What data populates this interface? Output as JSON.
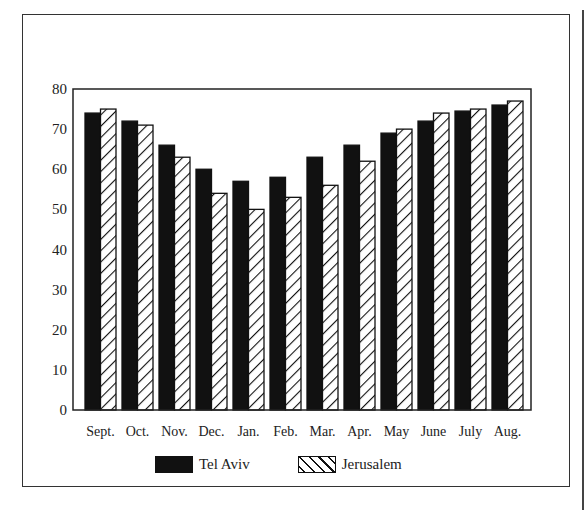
{
  "chart_data": {
    "type": "bar",
    "title": "",
    "xlabel": "",
    "ylabel": "",
    "ylim": [
      0,
      80
    ],
    "yticks": [
      0,
      10,
      20,
      30,
      40,
      50,
      60,
      70,
      80
    ],
    "grid": false,
    "legend_position": "bottom",
    "categories": [
      "Sept.",
      "Oct.",
      "Nov.",
      "Dec.",
      "Jan.",
      "Feb.",
      "Mar.",
      "Apr.",
      "May",
      "June",
      "July",
      "Aug."
    ],
    "series": [
      {
        "name": "Tel Aviv",
        "pattern": "solid",
        "color": "#111111",
        "values": [
          74,
          72,
          66,
          60,
          57,
          58,
          63,
          66,
          69,
          72,
          74.5,
          76
        ]
      },
      {
        "name": "Jerusalem",
        "pattern": "hatched",
        "color": "#ffffff",
        "values": [
          75,
          71,
          63,
          54,
          50,
          53,
          56,
          62,
          70,
          74,
          75,
          77
        ]
      }
    ]
  },
  "legend": {
    "tel_aviv": "Tel Aviv",
    "jerusalem": "Jerusalem"
  }
}
